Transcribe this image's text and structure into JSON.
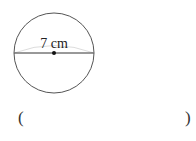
{
  "figure": {
    "shape": "circle",
    "measurement_label": "7 cm",
    "measured_segment": "diameter"
  },
  "answer": {
    "open_paren": "(",
    "close_paren": ")",
    "value": ""
  }
}
